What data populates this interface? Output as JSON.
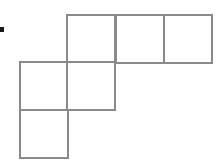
{
  "figure": {
    "name": "polyomino-grid-figure",
    "background_color": "#ffffff",
    "stroke_color": "#8a8a8a",
    "stroke_width": 2.5,
    "fill_color": "#ffffff",
    "cell_size": 48,
    "cells": [
      {
        "id": "cell-top-left",
        "label": "top row square 1",
        "col": 1,
        "row": 0,
        "x": 67,
        "y": 15
      },
      {
        "id": "cell-top-middle",
        "label": "top row square 2",
        "col": 2,
        "row": 0,
        "x": 116,
        "y": 15
      },
      {
        "id": "cell-top-right",
        "label": "top row square 3",
        "col": 3,
        "row": 0,
        "x": 164,
        "y": 15
      },
      {
        "id": "cell-middle-left",
        "label": "middle row square 1",
        "col": 0,
        "row": 1,
        "x": 20,
        "y": 62
      },
      {
        "id": "cell-middle-right",
        "label": "middle row square 2",
        "col": 1,
        "row": 1,
        "x": 67,
        "y": 62
      },
      {
        "id": "cell-bottom-left",
        "label": "bottom row square 1",
        "col": 0,
        "row": 2,
        "x": 20,
        "y": 110
      }
    ]
  },
  "bullet": {
    "name": "bullet-marker",
    "color": "#1a1a1a",
    "x": 0,
    "y": 27,
    "width": 4,
    "height": 5
  }
}
